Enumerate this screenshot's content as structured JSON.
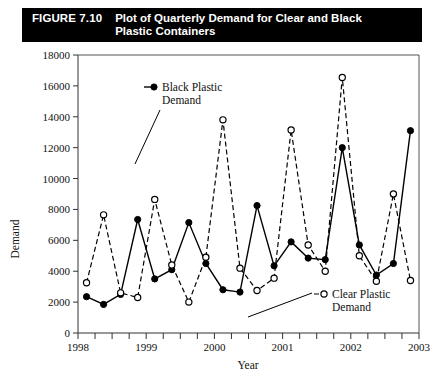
{
  "figure": {
    "number": "FIGURE 7.10",
    "title": "Plot of Quarterly Demand for Clear and Black Plastic Containers",
    "title_line1": "Plot of Quarterly Demand for Clear and Black",
    "title_line2": "Plastic Containers",
    "bar_color": "#000000",
    "bar_text_color": "#ffffff"
  },
  "annotations": {
    "black_label_line1": "Black Plastic",
    "black_label_line2": "Demand",
    "clear_label_line1": "Clear Plastic",
    "clear_label_line2": "Demand"
  },
  "chart_data": {
    "type": "line",
    "title": "Plot of Quarterly Demand for Clear and Black Plastic Containers",
    "xlabel": "Year",
    "ylabel": "Demand",
    "ylim": [
      0,
      18000
    ],
    "ytick_values": [
      0,
      2000,
      4000,
      6000,
      8000,
      10000,
      12000,
      14000,
      16000,
      18000
    ],
    "ytick_labels": [
      "0",
      "2000",
      "4000",
      "6000",
      "8000",
      "10000",
      "12000",
      "14000",
      "16000",
      "18000"
    ],
    "xlim": [
      1998,
      2003
    ],
    "xtick_labels": [
      "1998",
      "1999",
      "2000",
      "2001",
      "2002",
      "2003"
    ],
    "xtick_values": [
      1998,
      1999,
      2000,
      2001,
      2002,
      2003
    ],
    "x_minor_ticks_per_year": 4,
    "grid": false,
    "legend_position": "inside-annotations",
    "x": [
      1998.125,
      1998.375,
      1998.625,
      1998.875,
      1999.125,
      1999.375,
      1999.625,
      1999.875,
      2000.125,
      2000.375,
      2000.625,
      2000.875,
      2001.125,
      2001.375,
      2001.625,
      2001.875,
      2002.125,
      2002.375,
      2002.625,
      2002.875
    ],
    "x_quarter_labels": [
      "1998 Q1",
      "1998 Q2",
      "1998 Q3",
      "1998 Q4",
      "1999 Q1",
      "1999 Q2",
      "1999 Q3",
      "1999 Q4",
      "2000 Q1",
      "2000 Q2",
      "2000 Q3",
      "2000 Q4",
      "2001 Q1",
      "2001 Q2",
      "2001 Q3",
      "2001 Q4",
      "2002 Q1",
      "2002 Q2",
      "2002 Q3",
      "2002 Q4"
    ],
    "series": [
      {
        "name": "Black Plastic Demand",
        "marker": "filled-circle",
        "linestyle": "solid",
        "color": "#000000",
        "values": [
          2350,
          1850,
          2500,
          7350,
          3500,
          4100,
          7150,
          4500,
          2800,
          2650,
          8250,
          4350,
          5900,
          4850,
          4750,
          12000,
          5700,
          3750,
          4500,
          13100
        ]
      },
      {
        "name": "Clear Plastic Demand",
        "marker": "open-circle",
        "linestyle": "dashed",
        "color": "#000000",
        "values": [
          3250,
          7650,
          2600,
          2300,
          8650,
          4400,
          2000,
          4900,
          13800,
          4200,
          2750,
          3550,
          13150,
          5700,
          4000,
          16550,
          5000,
          3350,
          9000,
          3400
        ]
      }
    ]
  }
}
